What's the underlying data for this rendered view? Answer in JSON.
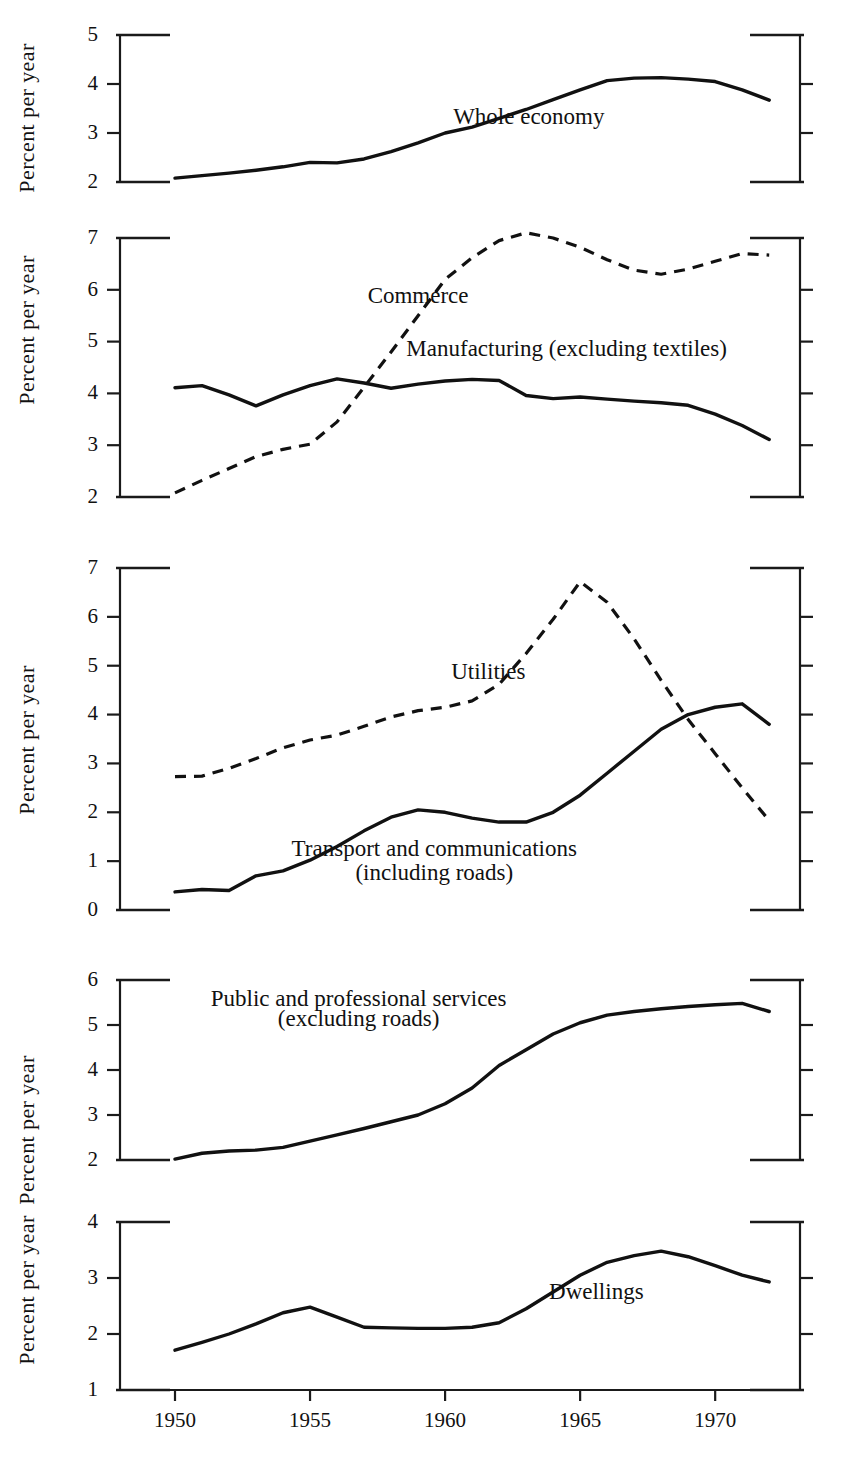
{
  "figure": {
    "width": 860,
    "height": 1465,
    "background": "#ffffff",
    "ink_color": "#111111",
    "axis_title": "Percent per year",
    "x_tick_labels": [
      "1950",
      "1955",
      "1960",
      "1965",
      "1970"
    ],
    "x_ticks": [
      1950,
      1955,
      1960,
      1965,
      1970
    ],
    "x_range": [
      1948.6,
      1973.0
    ],
    "x_data_range": [
      1950,
      1972
    ]
  },
  "chart_data": [
    {
      "type": "line",
      "panel": 1,
      "title": "",
      "xlabel": "",
      "ylabel": "Percent per year",
      "ylim": [
        2,
        5
      ],
      "yticks": [
        2,
        3,
        4,
        5
      ],
      "ytick_labels": [
        "2",
        "3",
        "4",
        "5"
      ],
      "xlim": [
        1948.6,
        1973.0
      ],
      "grid": false,
      "legend": "inline-annotation",
      "series": [
        {
          "name": "Whole economy",
          "style": "solid",
          "label_x": 1963.1,
          "label_y": 3.18,
          "x": [
            1950,
            1951,
            1952,
            1953,
            1954,
            1955,
            1956,
            1957,
            1958,
            1959,
            1960,
            1961,
            1962,
            1963,
            1964,
            1965,
            1966,
            1967,
            1968,
            1969,
            1970,
            1971,
            1972
          ],
          "values": [
            2.08,
            2.13,
            2.18,
            2.24,
            2.31,
            2.4,
            2.39,
            2.47,
            2.62,
            2.8,
            3.0,
            3.12,
            3.3,
            3.48,
            3.68,
            3.88,
            4.07,
            4.12,
            4.13,
            4.1,
            4.05,
            3.88,
            3.67
          ]
        }
      ]
    },
    {
      "type": "line",
      "panel": 2,
      "title": "",
      "xlabel": "",
      "ylabel": "Percent per year",
      "ylim": [
        2,
        7
      ],
      "yticks": [
        2,
        3,
        4,
        5,
        6,
        7
      ],
      "ytick_labels": [
        "2",
        "3",
        "4",
        "5",
        "6",
        "7"
      ],
      "xlim": [
        1948.6,
        1973.0
      ],
      "grid": false,
      "legend": "inline-annotation",
      "series": [
        {
          "name": "Commerce",
          "style": "dashed",
          "label_x": 1959.0,
          "label_y": 5.74,
          "x": [
            1950,
            1951,
            1952,
            1953,
            1954,
            1955,
            1956,
            1957,
            1958,
            1959,
            1960,
            1961,
            1962,
            1963,
            1964,
            1965,
            1966,
            1967,
            1968,
            1969,
            1970,
            1971,
            1972
          ],
          "values": [
            2.08,
            2.32,
            2.55,
            2.78,
            2.92,
            3.02,
            3.45,
            4.12,
            4.8,
            5.5,
            6.2,
            6.62,
            6.95,
            7.1,
            7.0,
            6.82,
            6.58,
            6.38,
            6.3,
            6.4,
            6.55,
            6.7,
            6.67
          ]
        },
        {
          "name": "Manufacturing (excluding textiles)",
          "style": "solid",
          "label_x": 1964.5,
          "label_y": 4.72,
          "x": [
            1950,
            1951,
            1952,
            1953,
            1954,
            1955,
            1956,
            1957,
            1958,
            1959,
            1960,
            1961,
            1962,
            1963,
            1964,
            1965,
            1966,
            1967,
            1968,
            1969,
            1970,
            1971,
            1972
          ],
          "values": [
            4.11,
            4.15,
            3.97,
            3.76,
            3.97,
            4.15,
            4.28,
            4.2,
            4.1,
            4.18,
            4.24,
            4.27,
            4.25,
            3.96,
            3.9,
            3.93,
            3.89,
            3.85,
            3.82,
            3.77,
            3.6,
            3.38,
            3.11
          ]
        }
      ]
    },
    {
      "type": "line",
      "panel": 3,
      "title": "",
      "xlabel": "",
      "ylabel": "Percent per year",
      "ylim": [
        0,
        7
      ],
      "yticks": [
        0,
        1,
        2,
        3,
        4,
        5,
        6,
        7
      ],
      "ytick_labels": [
        "0",
        "1",
        "2",
        "3",
        "4",
        "5",
        "6",
        "7"
      ],
      "xlim": [
        1948.6,
        1973.0
      ],
      "grid": false,
      "legend": "inline-annotation",
      "series": [
        {
          "name": "Utilities",
          "style": "dashed",
          "label_x": 1961.6,
          "label_y": 4.72,
          "x": [
            1950,
            1951,
            1952,
            1953,
            1954,
            1955,
            1956,
            1957,
            1958,
            1959,
            1960,
            1961,
            1962,
            1963,
            1964,
            1965,
            1966,
            1967,
            1968,
            1969,
            1970,
            1971,
            1972
          ],
          "values": [
            2.73,
            2.74,
            2.9,
            3.1,
            3.32,
            3.48,
            3.58,
            3.76,
            3.95,
            4.08,
            4.15,
            4.28,
            4.62,
            5.25,
            5.95,
            6.72,
            6.3,
            5.55,
            4.7,
            3.9,
            3.2,
            2.5,
            1.83
          ]
        },
        {
          "name": "Transport and communications",
          "name_line2": "(including roads)",
          "style": "solid",
          "label_x": 1959.6,
          "label_y": 1.1,
          "label2_y": 0.62,
          "x": [
            1950,
            1951,
            1952,
            1953,
            1954,
            1955,
            1956,
            1957,
            1958,
            1959,
            1960,
            1961,
            1962,
            1963,
            1964,
            1965,
            1966,
            1967,
            1968,
            1969,
            1970,
            1971,
            1972
          ],
          "values": [
            0.37,
            0.42,
            0.4,
            0.7,
            0.8,
            1.02,
            1.3,
            1.62,
            1.9,
            2.05,
            2.0,
            1.88,
            1.8,
            1.8,
            2.0,
            2.35,
            2.8,
            3.25,
            3.7,
            4.0,
            4.15,
            4.22,
            3.8
          ]
        }
      ]
    },
    {
      "type": "line",
      "panel": 4,
      "title": "",
      "xlabel": "",
      "ylabel": "Percent per year",
      "ylim": [
        2,
        6
      ],
      "yticks": [
        2,
        3,
        4,
        5,
        6
      ],
      "ytick_labels": [
        "2",
        "3",
        "4",
        "5",
        "6"
      ],
      "xlim": [
        1948.6,
        1973.0
      ],
      "grid": false,
      "legend": "inline-annotation",
      "series": [
        {
          "name": "Public and professional services",
          "name_line2": "(excluding roads)",
          "style": "solid",
          "label_x": 1956.8,
          "label_y": 5.42,
          "label2_y": 4.98,
          "x": [
            1950,
            1951,
            1952,
            1953,
            1954,
            1955,
            1956,
            1957,
            1958,
            1959,
            1960,
            1961,
            1962,
            1963,
            1964,
            1965,
            1966,
            1967,
            1968,
            1969,
            1970,
            1971,
            1972
          ],
          "values": [
            2.02,
            2.15,
            2.2,
            2.22,
            2.28,
            2.42,
            2.56,
            2.7,
            2.85,
            3.0,
            3.25,
            3.6,
            4.1,
            4.45,
            4.8,
            5.05,
            5.22,
            5.3,
            5.36,
            5.41,
            5.45,
            5.48,
            5.3
          ]
        }
      ]
    },
    {
      "type": "line",
      "panel": 5,
      "title": "",
      "xlabel": "",
      "ylabel": "Percent per year",
      "ylim": [
        1,
        4
      ],
      "yticks": [
        1,
        2,
        3,
        4
      ],
      "ytick_labels": [
        "1",
        "2",
        "3",
        "4"
      ],
      "xlim": [
        1948.6,
        1973.0
      ],
      "grid": false,
      "legend": "inline-annotation",
      "series": [
        {
          "name": "Dwellings",
          "style": "solid",
          "label_x": 1965.6,
          "label_y": 2.62,
          "x": [
            1950,
            1951,
            1952,
            1953,
            1954,
            1955,
            1956,
            1957,
            1958,
            1959,
            1960,
            1961,
            1962,
            1963,
            1964,
            1965,
            1966,
            1967,
            1968,
            1969,
            1970,
            1971,
            1972
          ],
          "values": [
            1.71,
            1.85,
            2.0,
            2.18,
            2.38,
            2.48,
            2.3,
            2.12,
            2.11,
            2.1,
            2.1,
            2.12,
            2.2,
            2.45,
            2.75,
            3.05,
            3.28,
            3.4,
            3.48,
            3.38,
            3.22,
            3.05,
            2.93
          ]
        }
      ]
    }
  ]
}
